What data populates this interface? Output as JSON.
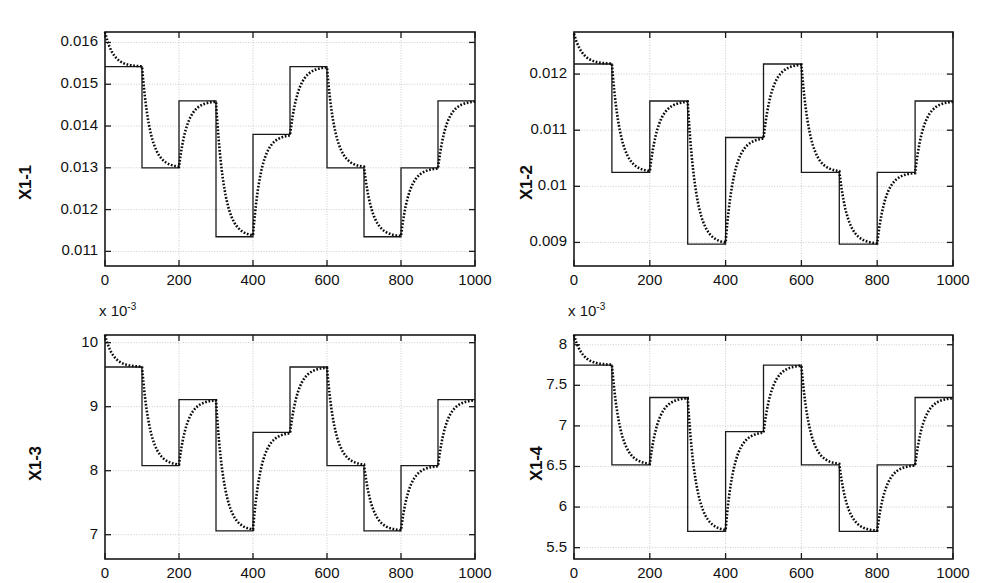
{
  "figure": {
    "type": "multi-panel-step-response",
    "panels": 4,
    "layout": "2x2",
    "background": "#ffffff",
    "line_colors": {
      "reference": "#1a1a1a",
      "response": "#0a0a0a"
    }
  },
  "chart_data": [
    {
      "id": "x1-1",
      "type": "line",
      "title": "",
      "ylabel": "X1-1",
      "xlabel": "",
      "exponent_label": "",
      "xlim": [
        0,
        1000
      ],
      "ylim": [
        0.01065,
        0.01625
      ],
      "xticks": [
        0,
        200,
        400,
        600,
        800,
        1000
      ],
      "xticklabels": [
        "0",
        "200",
        "400",
        "600",
        "800",
        "1000"
      ],
      "yticks": [
        0.011,
        0.012,
        0.013,
        0.014,
        0.015,
        0.016
      ],
      "yticklabels": [
        "0.011",
        "0.012",
        "0.013",
        "0.014",
        "0.015",
        "0.016"
      ],
      "grid": true,
      "legend": null,
      "step_edges": [
        0,
        100,
        200,
        300,
        400,
        500,
        600,
        700,
        800,
        900,
        1000
      ],
      "series": [
        {
          "name": "reference",
          "style": "solid",
          "levels": [
            0.01542,
            0.013,
            0.0146,
            0.01135,
            0.0138,
            0.01542,
            0.013,
            0.01135,
            0.013,
            0.0146
          ]
        },
        {
          "name": "response",
          "style": "dotted",
          "initial_value": 0.01625,
          "tau": 22,
          "levels": [
            0.01542,
            0.013,
            0.0146,
            0.01135,
            0.0138,
            0.01542,
            0.013,
            0.01135,
            0.013,
            0.0146
          ]
        }
      ]
    },
    {
      "id": "x1-2",
      "type": "line",
      "title": "",
      "ylabel": "X1-2",
      "xlabel": "",
      "exponent_label": "",
      "xlim": [
        0,
        1000
      ],
      "ylim": [
        0.00858,
        0.01275
      ],
      "xticks": [
        0,
        200,
        400,
        600,
        800,
        1000
      ],
      "xticklabels": [
        "0",
        "200",
        "400",
        "600",
        "800",
        "1000"
      ],
      "yticks": [
        0.009,
        0.01,
        0.011,
        0.012
      ],
      "yticklabels": [
        "0.009",
        "0.01",
        "0.011",
        "0.012"
      ],
      "grid": true,
      "legend": null,
      "step_edges": [
        0,
        100,
        200,
        300,
        400,
        500,
        600,
        700,
        800,
        900,
        1000
      ],
      "series": [
        {
          "name": "reference",
          "style": "solid",
          "levels": [
            0.01218,
            0.01025,
            0.01152,
            0.00897,
            0.01087,
            0.01218,
            0.01025,
            0.00897,
            0.01025,
            0.01152
          ]
        },
        {
          "name": "response",
          "style": "dotted",
          "initial_value": 0.01272,
          "tau": 22,
          "levels": [
            0.01218,
            0.01025,
            0.01152,
            0.00897,
            0.01087,
            0.01218,
            0.01025,
            0.00897,
            0.01025,
            0.01152
          ]
        }
      ]
    },
    {
      "id": "x1-3",
      "type": "line",
      "title": "",
      "ylabel": "X1-3",
      "xlabel": "",
      "exponent_label": "x 10",
      "exponent_superscript": "-3",
      "xlim": [
        0,
        1000
      ],
      "ylim": [
        6.62,
        10.12
      ],
      "xticks": [
        0,
        200,
        400,
        600,
        800,
        1000
      ],
      "xticklabels": [
        "0",
        "200",
        "400",
        "600",
        "800",
        "1000"
      ],
      "yticks": [
        7,
        8,
        9,
        10
      ],
      "yticklabels": [
        "7",
        "8",
        "9",
        "10"
      ],
      "grid": true,
      "legend": null,
      "step_edges": [
        0,
        100,
        200,
        300,
        400,
        500,
        600,
        700,
        800,
        900,
        1000
      ],
      "series": [
        {
          "name": "reference",
          "style": "solid",
          "levels": [
            9.62,
            8.08,
            9.11,
            7.06,
            8.6,
            9.62,
            8.08,
            7.06,
            8.08,
            9.11
          ]
        },
        {
          "name": "response",
          "style": "dotted",
          "initial_value": 10.12,
          "tau": 22,
          "levels": [
            9.62,
            8.08,
            9.11,
            7.06,
            8.6,
            9.62,
            8.08,
            7.06,
            8.08,
            9.11
          ]
        }
      ]
    },
    {
      "id": "x1-4",
      "type": "line",
      "title": "",
      "ylabel": "X1-4",
      "xlabel": "",
      "exponent_label": "x 10",
      "exponent_superscript": "-3",
      "xlim": [
        0,
        1000
      ],
      "ylim": [
        5.36,
        8.12
      ],
      "xticks": [
        0,
        200,
        400,
        600,
        800,
        1000
      ],
      "xticklabels": [
        "0",
        "200",
        "400",
        "600",
        "800",
        "1000"
      ],
      "yticks": [
        5.5,
        6,
        6.5,
        7,
        7.5,
        8
      ],
      "yticklabels": [
        "5.5",
        "6",
        "6.5",
        "7",
        "7.5",
        "8"
      ],
      "grid": true,
      "legend": null,
      "step_edges": [
        0,
        100,
        200,
        300,
        400,
        500,
        600,
        700,
        800,
        900,
        1000
      ],
      "series": [
        {
          "name": "reference",
          "style": "solid",
          "levels": [
            7.75,
            6.52,
            7.35,
            5.7,
            6.93,
            7.75,
            6.52,
            5.7,
            6.52,
            7.35
          ]
        },
        {
          "name": "response",
          "style": "dotted",
          "initial_value": 8.12,
          "tau": 22,
          "levels": [
            7.75,
            6.52,
            7.35,
            5.7,
            6.93,
            7.75,
            6.52,
            5.7,
            6.52,
            7.35
          ]
        }
      ]
    }
  ]
}
